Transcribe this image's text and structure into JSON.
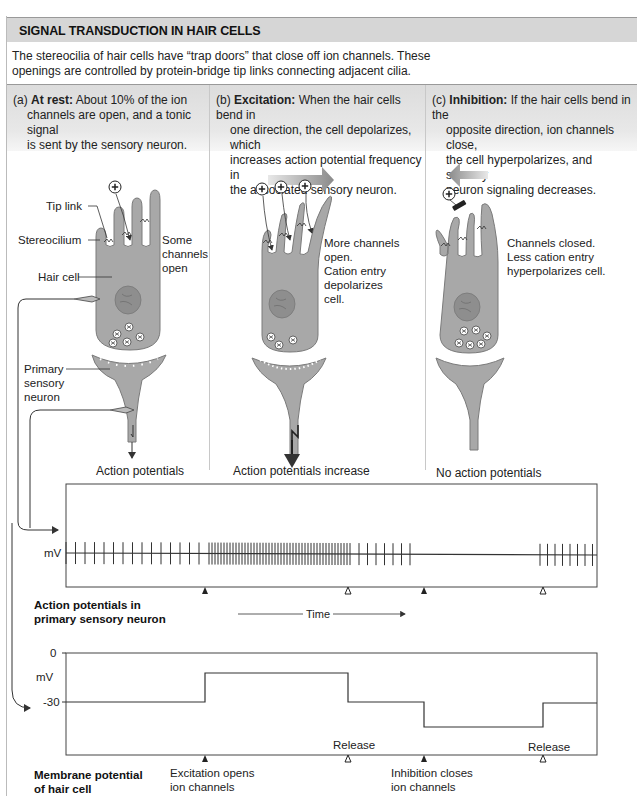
{
  "header": {
    "title": "SIGNAL TRANSDUCTION IN HAIR CELLS",
    "intro_line1": "The stereocilia of hair cells have “trap doors” that close off ion channels. These",
    "intro_line2": "openings are controlled by protein-bridge tip links connecting adjacent cilia."
  },
  "panels": [
    {
      "id": "a",
      "prefix": "(a) ",
      "heading": "At rest:",
      "lines": [
        " About 10% of the ion",
        "channels are open, and a tonic signal",
        "is sent by the sensory neuron."
      ],
      "callouts": {
        "tip_link": "Tip link",
        "stereocilium": "Stereocilium",
        "hair_cell": "Hair cell",
        "primary1": "Primary",
        "primary2": "sensory",
        "primary3": "neuron",
        "side1": "Some",
        "side2": "channels",
        "side3": "open"
      },
      "output_label": "Action potentials"
    },
    {
      "id": "b",
      "prefix": "(b) ",
      "heading": "Excitation:",
      "lines": [
        " When the hair cells bend in",
        "one direction, the cell depolarizes, which",
        "increases action potential frequency in",
        "the associated sensory neuron."
      ],
      "callouts": {
        "side1": "More channels",
        "side2": "open.",
        "side3": "Cation entry",
        "side4": "depolarizes",
        "side5": "cell."
      },
      "output_label": "Action potentials increase"
    },
    {
      "id": "c",
      "prefix": "(c) ",
      "heading": "Inhibition:",
      "lines": [
        " If the hair cells bend in the",
        "opposite direction, ion channels close,",
        "the cell hyperpolarizes, and sensory",
        "neuron signaling decreases."
      ],
      "callouts": {
        "side1": "Channels closed.",
        "side2": "Less cation entry",
        "side3": "hyperpolarizes cell."
      },
      "output_label": "No action potentials"
    }
  ],
  "chart_data": [
    {
      "type": "line",
      "title": "Action potentials in primary sensory neuron",
      "title_line1": "Action potentials in",
      "title_line2": "primary sensory neuron",
      "ylabel": "mV",
      "xlabel": "Time",
      "description": "Spike train: tonic firing at rest, high-frequency burst during excitation, medium after release, silence during inhibition, resumed after release",
      "segments": [
        {
          "phase": "rest",
          "x_start": 66,
          "x_end": 201,
          "spikes": 15,
          "spacing_px": 9.5
        },
        {
          "phase": "excitation",
          "x_start": 209,
          "x_end": 351,
          "spikes": 48,
          "spacing_px": 3.0
        },
        {
          "phase": "after_release",
          "x_start": 359,
          "x_end": 421,
          "spikes": 7,
          "spacing_px": 8.5
        },
        {
          "phase": "inhibition",
          "x_start": 421,
          "x_end": 538,
          "spikes": 0
        },
        {
          "phase": "after_release",
          "x_start": 540,
          "x_end": 595,
          "spikes": 8,
          "spacing_px": 7.5
        }
      ],
      "markers": [
        {
          "x": 205,
          "type": "filled"
        },
        {
          "x": 348,
          "type": "open"
        },
        {
          "x": 424,
          "type": "filled"
        },
        {
          "x": 543,
          "type": "open"
        }
      ]
    },
    {
      "type": "line",
      "title": "Membrane potential of hair cell",
      "title_line1": "Membrane potential",
      "title_line2": "of hair cell",
      "ylabel": "mV",
      "yticks": [
        "0",
        "-30"
      ],
      "x": [
        "start",
        "excitation",
        "release",
        "inhibition",
        "release",
        "end"
      ],
      "values_mV": [
        -30,
        -12,
        -30,
        -46,
        -30,
        -30
      ],
      "steps": [
        {
          "from_x": 66,
          "to_x": 205,
          "mV": -30
        },
        {
          "from_x": 205,
          "to_x": 348,
          "mV": -12
        },
        {
          "from_x": 348,
          "to_x": 424,
          "mV": -30
        },
        {
          "from_x": 424,
          "to_x": 543,
          "mV": -46
        },
        {
          "from_x": 543,
          "to_x": 597,
          "mV": -30
        }
      ],
      "annotations": {
        "exc1": "Excitation opens",
        "exc2": "ion channels",
        "inh1": "Inhibition closes",
        "inh2": "ion channels",
        "release": "Release"
      },
      "markers": [
        {
          "x": 205,
          "type": "filled"
        },
        {
          "x": 348,
          "type": "open"
        },
        {
          "x": 424,
          "type": "filled"
        },
        {
          "x": 543,
          "type": "open"
        }
      ]
    }
  ],
  "colors": {
    "title_bar": "#d6d6d6",
    "cell_fill": "#a8a8a8",
    "cell_stroke": "#7a7a7a",
    "nucleus": "#8e8e8e",
    "trace": "#333333"
  }
}
